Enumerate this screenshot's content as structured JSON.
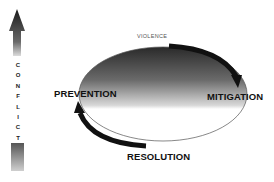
{
  "diagram": {
    "axis": {
      "label": "CONFLICT",
      "letters": [
        "C",
        "O",
        "N",
        "F",
        "L",
        "I",
        "C",
        "T"
      ],
      "direction": "up"
    },
    "cycle": {
      "top_label": "VIOLENCE",
      "left_label": "PREVENTION",
      "right_label": "MITIGATION",
      "bottom_label": "RESOLUTION",
      "arrows": [
        {
          "from": "top",
          "to": "right",
          "direction": "clockwise"
        },
        {
          "from": "bottom",
          "to": "left",
          "direction": "clockwise"
        }
      ]
    },
    "colors": {
      "gradient_dark": "#2a2a2a",
      "gradient_light": "#ffffff",
      "arrow": "#111111",
      "text": "#111111"
    }
  }
}
